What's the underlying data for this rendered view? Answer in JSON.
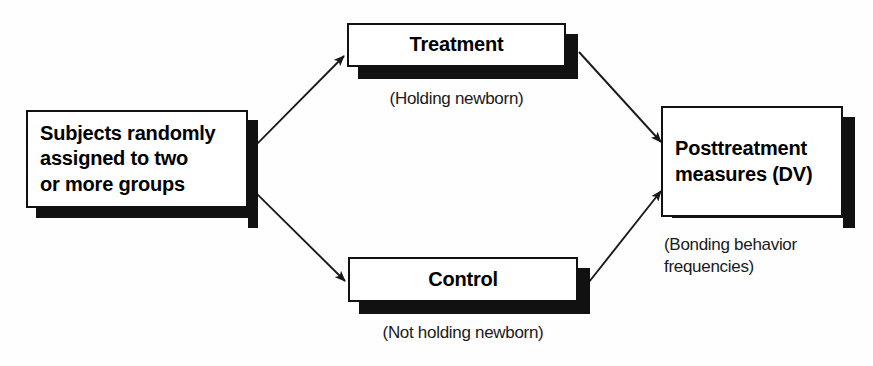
{
  "diagram": {
    "background_color": "#fefefe",
    "line_color": "#1a1a1a",
    "box_fill": "#ffffff",
    "shadow_color": "#111111",
    "nodes": [
      {
        "id": "subjects",
        "label": "Subjects randomly\nassigned to two\nor more groups",
        "caption": ""
      },
      {
        "id": "treatment",
        "label": "Treatment",
        "caption": "(Holding newborn)"
      },
      {
        "id": "control",
        "label": "Control",
        "caption": "(Not holding newborn)"
      },
      {
        "id": "posttreatment",
        "label": "Posttreatment\nmeasures (DV)",
        "caption": "(Bonding behavior\nfrequencies)"
      }
    ],
    "edges": [
      {
        "id": "subjects-to-treatment",
        "from": "subjects",
        "to": "treatment"
      },
      {
        "id": "subjects-to-control",
        "from": "subjects",
        "to": "control"
      },
      {
        "id": "treatment-to-posttreatment",
        "from": "treatment",
        "to": "posttreatment"
      },
      {
        "id": "control-to-posttreatment",
        "from": "control",
        "to": "posttreatment"
      }
    ]
  }
}
